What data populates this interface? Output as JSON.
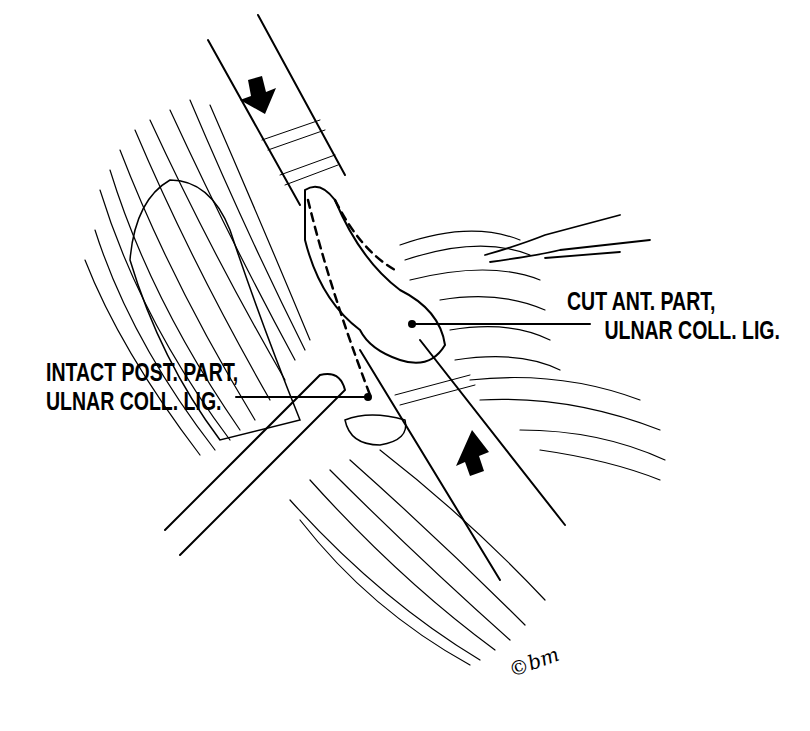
{
  "figure": {
    "labels": {
      "cut_anterior": {
        "line1": "CUT ANT. PART,",
        "line2": "ULNAR COLL. LIG."
      },
      "intact_posterior": {
        "line1": "INTACT POST. PART,",
        "line2": "ULNAR COLL. LIG."
      }
    },
    "signature": "©bm",
    "arrows": [
      {
        "name": "downward-arrow",
        "direction": "down"
      },
      {
        "name": "upward-arrow",
        "direction": "up"
      }
    ],
    "colors": {
      "ink": "#000000",
      "paper": "#ffffff"
    }
  }
}
